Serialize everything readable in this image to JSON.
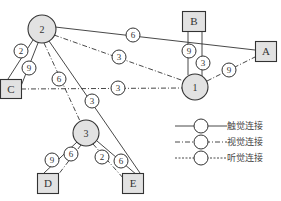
{
  "diagram": {
    "colors": {
      "stroke": "#333333",
      "node_fill": "#e2e2e2",
      "label_fill": "#ffffff",
      "text": "#333333"
    },
    "hubs": [
      {
        "id": "2",
        "label": "2",
        "cx": 42,
        "cy": 29,
        "r": 14
      },
      {
        "id": "1",
        "label": "1",
        "cx": 195,
        "cy": 87,
        "r": 13
      },
      {
        "id": "3",
        "label": "3",
        "cx": 86,
        "cy": 133,
        "r": 13
      }
    ],
    "terminals": [
      {
        "id": "B",
        "label": "B",
        "x": 182,
        "y": 11,
        "w": 23,
        "h": 20
      },
      {
        "id": "A",
        "label": "A",
        "x": 255,
        "y": 41,
        "w": 21,
        "h": 20
      },
      {
        "id": "C",
        "label": "C",
        "x": 0,
        "y": 79,
        "w": 21,
        "h": 19
      },
      {
        "id": "D",
        "label": "D",
        "x": 37,
        "y": 173,
        "w": 21,
        "h": 20
      },
      {
        "id": "E",
        "label": "E",
        "x": 122,
        "y": 173,
        "w": 21,
        "h": 20
      }
    ],
    "links": [
      {
        "from": "2",
        "to": "A",
        "type": "touch",
        "weight": "6",
        "x1": 55,
        "y1": 27,
        "x2": 255,
        "y2": 50,
        "lx": 133,
        "ly": 35
      },
      {
        "from": "2",
        "to": "1",
        "type": "visual",
        "weight": "3",
        "x1": 54,
        "y1": 35,
        "x2": 184,
        "y2": 81,
        "lx": 119,
        "ly": 57
      },
      {
        "from": "2",
        "to": "C",
        "type": "touch",
        "weight": "2",
        "x1": 33,
        "y1": 40,
        "x2": 8,
        "y2": 79,
        "lx": 21,
        "ly": 51
      },
      {
        "from": "2",
        "to": "C",
        "type": "touch",
        "weight": "9",
        "x1": 38,
        "y1": 43,
        "x2": 21,
        "y2": 86,
        "lx": 29,
        "ly": 68
      },
      {
        "from": "2",
        "to": "3",
        "type": "visual",
        "weight": "6",
        "x1": 44,
        "y1": 43,
        "x2": 80,
        "y2": 121,
        "lx": 59,
        "ly": 79
      },
      {
        "from": "2",
        "to": "E",
        "type": "touch",
        "weight": "3",
        "x1": 49,
        "y1": 41,
        "x2": 140,
        "y2": 173,
        "lx": 92,
        "ly": 101
      },
      {
        "from": "C",
        "to": "1",
        "type": "visual",
        "weight": "3",
        "x1": 21,
        "y1": 89,
        "x2": 182,
        "y2": 88,
        "lx": 118,
        "ly": 88
      },
      {
        "from": "B",
        "to": "1",
        "type": "touch",
        "weight": "9",
        "x1": 188,
        "y1": 31,
        "x2": 188,
        "y2": 75,
        "lx": 189,
        "ly": 51
      },
      {
        "from": "B",
        "to": "1",
        "type": "touch",
        "weight": "3",
        "x1": 202,
        "y1": 31,
        "x2": 202,
        "y2": 76,
        "lx": 203,
        "ly": 63
      },
      {
        "from": "1",
        "to": "A",
        "type": "visual",
        "weight": "9",
        "x1": 207,
        "y1": 81,
        "x2": 255,
        "y2": 57,
        "lx": 229,
        "ly": 70
      },
      {
        "from": "3",
        "to": "D",
        "type": "touch",
        "weight": "9",
        "x1": 77,
        "y1": 142,
        "x2": 44,
        "y2": 173,
        "lx": 52,
        "ly": 160
      },
      {
        "from": "3",
        "to": "D",
        "type": "visual",
        "weight": "6",
        "x1": 81,
        "y1": 145,
        "x2": 58,
        "y2": 175,
        "lx": 71,
        "ly": 154
      },
      {
        "from": "3",
        "to": "E",
        "type": "visual",
        "weight": "2",
        "x1": 93,
        "y1": 144,
        "x2": 124,
        "y2": 179,
        "lx": 102,
        "ly": 157
      },
      {
        "from": "3",
        "to": "E",
        "type": "touch",
        "weight": "6",
        "x1": 97,
        "y1": 141,
        "x2": 137,
        "y2": 175,
        "lx": 121,
        "ly": 161
      }
    ],
    "legend": {
      "items": [
        {
          "type": "touch",
          "label": "触觉连接"
        },
        {
          "type": "visual",
          "label": "视觉连接"
        },
        {
          "type": "auditory",
          "label": "听觉连接"
        }
      ]
    },
    "line_styles": {
      "touch": "",
      "visual": "5,2,1,2",
      "auditory": "2,1.5"
    }
  }
}
